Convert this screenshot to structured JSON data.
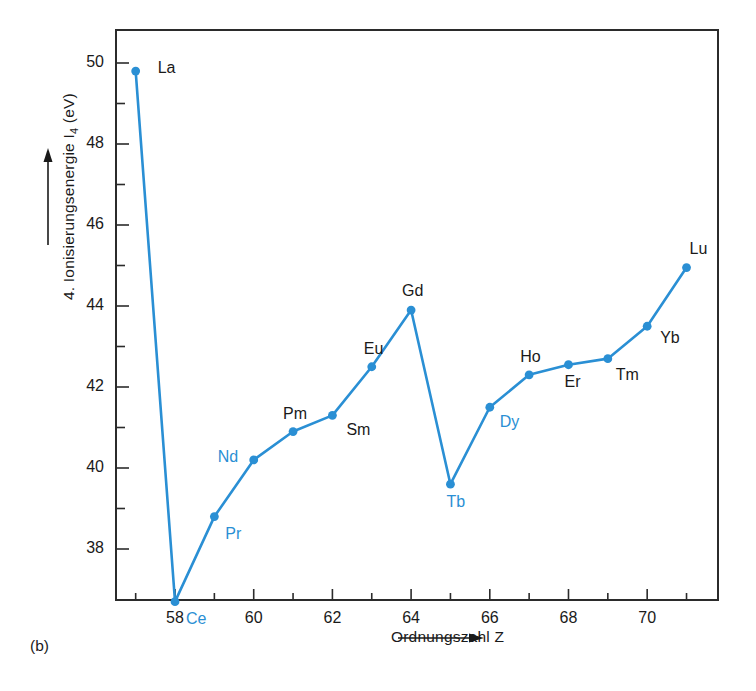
{
  "figure": {
    "panel_caption": "(b)",
    "accent_color": "#2a8fd4",
    "text_color": "#1a1a1a"
  },
  "chart_data": {
    "type": "line",
    "title": "",
    "xlabel": "Ordnungszahl  Z",
    "ylabel": "4. Ionisierungsenergie I4 (eV)",
    "ylabel_html": "4. Ionisierungsenergie I<sub>4</sub> (eV)",
    "xlim": [
      56.5,
      71.8
    ],
    "ylim": [
      36.0,
      50.6
    ],
    "grid": false,
    "legend": "none",
    "x_major_ticks": [
      58,
      60,
      62,
      64,
      66,
      68,
      70
    ],
    "x_minor_ticks": [
      57,
      59,
      61,
      63,
      65,
      67,
      69,
      71
    ],
    "x_tick_labels": [
      "58",
      "60",
      "62",
      "64",
      "66",
      "68",
      "70"
    ],
    "y_major_ticks": [
      38,
      40,
      42,
      44,
      46,
      48,
      50
    ],
    "y_minor_ticks": [
      39,
      41,
      43,
      45,
      47,
      49
    ],
    "y_tick_labels": [
      "38",
      "40",
      "42",
      "44",
      "46",
      "48",
      "50"
    ],
    "x": [
      57,
      58,
      59,
      60,
      61,
      62,
      63,
      64,
      65,
      66,
      67,
      68,
      69,
      70,
      71
    ],
    "values": [
      49.8,
      36.7,
      38.8,
      40.2,
      40.9,
      41.3,
      42.5,
      43.9,
      39.6,
      41.5,
      42.3,
      42.55,
      42.7,
      43.5,
      44.95
    ],
    "point_labels": [
      {
        "symbol": "La",
        "z": 57,
        "value": 49.8,
        "color": "black",
        "dx": 22,
        "dy": -11
      },
      {
        "symbol": "Ce",
        "z": 58,
        "value": 36.7,
        "color": "blue",
        "dx": 11,
        "dy": 9
      },
      {
        "symbol": "Pr",
        "z": 59,
        "value": 38.8,
        "color": "blue",
        "dx": 11,
        "dy": 9
      },
      {
        "symbol": "Nd",
        "z": 60,
        "value": 40.2,
        "color": "blue",
        "dx": -36,
        "dy": -11
      },
      {
        "symbol": "Pm",
        "z": 61,
        "value": 40.9,
        "color": "black",
        "dx": -10,
        "dy": -26
      },
      {
        "symbol": "Sm",
        "z": 62,
        "value": 41.3,
        "color": "black",
        "dx": 14,
        "dy": 7
      },
      {
        "symbol": "Eu",
        "z": 63,
        "value": 42.5,
        "color": "black",
        "dx": -8,
        "dy": -26
      },
      {
        "symbol": "Gd",
        "z": 64,
        "value": 43.9,
        "color": "black",
        "dx": -9,
        "dy": -27
      },
      {
        "symbol": "Tb",
        "z": 65,
        "value": 39.6,
        "color": "blue",
        "dx": -4,
        "dy": 10
      },
      {
        "symbol": "Dy",
        "z": 66,
        "value": 41.5,
        "color": "blue",
        "dx": 10,
        "dy": 7
      },
      {
        "symbol": "Ho",
        "z": 67,
        "value": 42.3,
        "color": "black",
        "dx": -9,
        "dy": -26
      },
      {
        "symbol": "Er",
        "z": 68,
        "value": 42.55,
        "color": "black",
        "dx": -4,
        "dy": 9
      },
      {
        "symbol": "Tm",
        "z": 69,
        "value": 42.7,
        "color": "black",
        "dx": 8,
        "dy": 8
      },
      {
        "symbol": "Yb",
        "z": 70,
        "value": 43.5,
        "color": "black",
        "dx": 13,
        "dy": 4
      },
      {
        "symbol": "Lu",
        "z": 71,
        "value": 44.95,
        "color": "black",
        "dx": 3,
        "dy": -27
      }
    ]
  }
}
